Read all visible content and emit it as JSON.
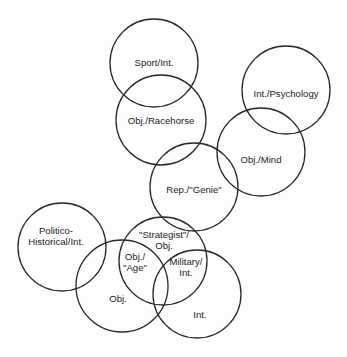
{
  "diagram": {
    "type": "overlapping-circles",
    "circles": [
      {
        "id": "sport",
        "cx": 154,
        "cy": 63,
        "r": 44,
        "lines": [
          "Sport/Int."
        ],
        "lx": 154,
        "ly": 66
      },
      {
        "id": "racehorse",
        "cx": 161,
        "cy": 120,
        "r": 45,
        "lines": [
          "Obj./Racehorse"
        ],
        "lx": 161,
        "ly": 124
      },
      {
        "id": "psychology",
        "cx": 286,
        "cy": 90,
        "r": 44,
        "lines": [
          "Int./Psychology"
        ],
        "lx": 286,
        "ly": 97
      },
      {
        "id": "mind",
        "cx": 261,
        "cy": 152,
        "r": 44,
        "lines": [
          "Obj./Mind"
        ],
        "lx": 261,
        "ly": 163
      },
      {
        "id": "genie",
        "cx": 194,
        "cy": 187,
        "r": 44,
        "lines": [
          "Rep./\"Genie\""
        ],
        "lx": 194,
        "ly": 193
      },
      {
        "id": "politico",
        "cx": 62,
        "cy": 247,
        "r": 44,
        "lines": [
          "Politico-",
          "Historical/Int."
        ],
        "lx": 56,
        "ly": 234
      },
      {
        "id": "obj",
        "cx": 122,
        "cy": 286,
        "r": 46,
        "lines": [
          "Obj."
        ],
        "lx": 118,
        "ly": 302
      },
      {
        "id": "strategist",
        "cx": 163,
        "cy": 261,
        "r": 44,
        "lines": [
          "\"Strategist\"/",
          "Obj."
        ],
        "lx": 164,
        "ly": 238
      },
      {
        "id": "int",
        "cx": 197,
        "cy": 294,
        "r": 44,
        "lines": [
          "Int."
        ],
        "lx": 200,
        "ly": 318
      }
    ],
    "overlap_labels": [
      {
        "id": "age",
        "lines": [
          "Obj./",
          "\"Age\""
        ],
        "lx": 135,
        "ly": 260
      },
      {
        "id": "military",
        "lines": [
          "Military/",
          "Int."
        ],
        "lx": 186,
        "ly": 265
      }
    ]
  }
}
